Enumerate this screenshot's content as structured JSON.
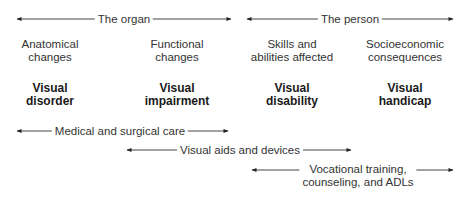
{
  "header_arrows": [
    {
      "label": "The organ",
      "x1": 17,
      "x2": 231,
      "y": 19
    },
    {
      "label": "The person",
      "x1": 247,
      "x2": 453,
      "y": 19
    }
  ],
  "stages": [
    {
      "description_lines": [
        "Anatomical",
        "changes"
      ],
      "term_lines": [
        "Visual",
        "disorder"
      ],
      "center_x": 50
    },
    {
      "description_lines": [
        "Functional",
        "changes"
      ],
      "term_lines": [
        "Visual",
        "impairment"
      ],
      "center_x": 177
    },
    {
      "description_lines": [
        "Skills and",
        "abilities affected"
      ],
      "term_lines": [
        "Visual",
        "disability"
      ],
      "center_x": 292
    },
    {
      "description_lines": [
        "Socioeconomic",
        "consequences"
      ],
      "term_lines": [
        "Visual",
        "handicap"
      ],
      "center_x": 405
    }
  ],
  "intervention_arrows": [
    {
      "label_lines": [
        "Medical and surgical care"
      ],
      "x1": 17,
      "x2": 228,
      "y": 131
    },
    {
      "label_lines": [
        "Visual aids and devices"
      ],
      "x1": 127,
      "x2": 351,
      "y": 150
    },
    {
      "label_lines": [
        "Vocational training,",
        "counseling, and ADLs"
      ],
      "x1": 252,
      "x2": 453,
      "y": 170
    }
  ],
  "colors": {
    "line": "#333333",
    "text": "#333333",
    "bold_text": "#1a1a1a",
    "background": "#ffffff"
  }
}
